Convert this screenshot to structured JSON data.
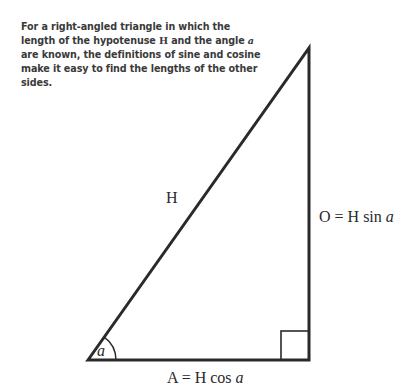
{
  "caption": {
    "part1": "For a right-angled triangle in which the length of the hypotenuse ",
    "hyp_symbol": "H",
    "part2": " and the angle ",
    "angle_symbol": "a",
    "part3": " are known, the definitions of sine and cosine make it easy to find the lengths of the other sides."
  },
  "labels": {
    "hypotenuse": "H",
    "opposite_prefix": "O = H sin ",
    "opposite_var": "a",
    "adjacent_prefix": "A = H cos ",
    "adjacent_var": "a",
    "angle": "a"
  },
  "colors": {
    "stroke": "#2a2a2a",
    "text": "#3a3a3a"
  }
}
